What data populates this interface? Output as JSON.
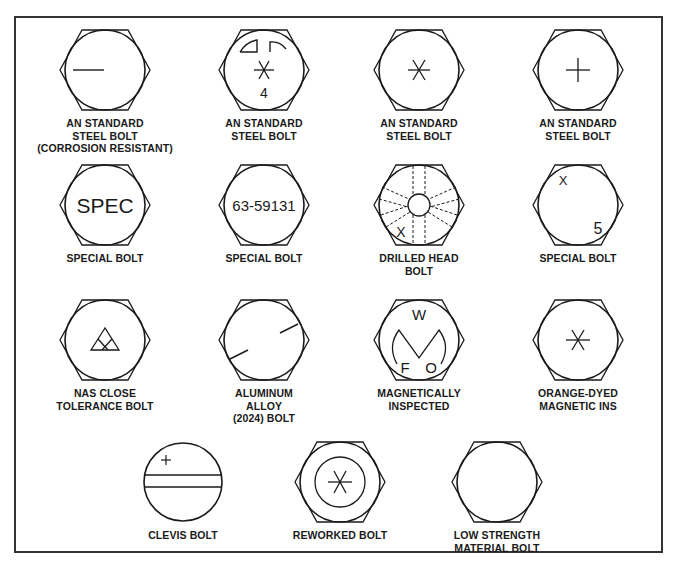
{
  "diagram": {
    "stroke_color": "#1a1a1a",
    "bolts": [
      {
        "id": "an-standard-steel-corrosion-resistant",
        "label": "AN STANDARD\nSTEEL BOLT\n(CORROSION RESISTANT)",
        "head": "hex",
        "marking": "single dash"
      },
      {
        "id": "an-standard-steel-raised-dashes",
        "label": "AN STANDARD\nSTEEL BOLT",
        "head": "hex",
        "marking": "asterisk with arcs and number",
        "mark_text": "4"
      },
      {
        "id": "an-standard-steel-asterisk",
        "label": "AN STANDARD\nSTEEL BOLT",
        "head": "hex",
        "marking": "asterisk"
      },
      {
        "id": "an-standard-steel-cross",
        "label": "AN STANDARD\nSTEEL BOLT",
        "head": "hex",
        "marking": "cross"
      },
      {
        "id": "special-bolt-spec",
        "label": "SPECIAL BOLT",
        "head": "hex",
        "marking": "text",
        "mark_text": "SPEC"
      },
      {
        "id": "special-bolt-number",
        "label": "SPECIAL BOLT",
        "head": "hex",
        "marking": "text",
        "mark_text": "63-59131"
      },
      {
        "id": "drilled-head-bolt",
        "label": "DRILLED HEAD\nBOLT",
        "head": "hex",
        "marking": "drilled holes with x",
        "mark_text": "X"
      },
      {
        "id": "special-bolt-x5",
        "label": "SPECIAL BOLT",
        "head": "hex",
        "marking": "x and number",
        "mark_text_1": "X",
        "mark_text_2": "5"
      },
      {
        "id": "nas-close-tolerance-bolt",
        "label": "NAS CLOSE\nTOLERANCE BOLT",
        "head": "hex",
        "marking": "triangle"
      },
      {
        "id": "aluminum-alloy-2024-bolt",
        "label": "ALUMINUM\nALLOY\n(2024) BOLT",
        "head": "hex",
        "marking": "two dashes"
      },
      {
        "id": "magnetically-inspected",
        "label": "MAGNETICALLY\nINSPECTED",
        "head": "hex",
        "marking": "letters with M shape",
        "mark_text_w": "W",
        "mark_text_f": "F",
        "mark_text_o": "O"
      },
      {
        "id": "orange-dyed-magnetic-ins",
        "label": "ORANGE-DYED\nMAGNETIC INS",
        "head": "hex",
        "marking": "asterisk"
      },
      {
        "id": "clevis-bolt",
        "label": "CLEVIS BOLT",
        "head": "round",
        "marking": "slot with cross"
      },
      {
        "id": "reworked-bolt",
        "label": "REWORKED BOLT",
        "head": "hex",
        "marking": "asterisk in inner circle"
      },
      {
        "id": "low-strength-material-bolt",
        "label": "LOW STRENGTH\nMATERIAL BOLT",
        "head": "hex",
        "marking": "none"
      }
    ]
  }
}
